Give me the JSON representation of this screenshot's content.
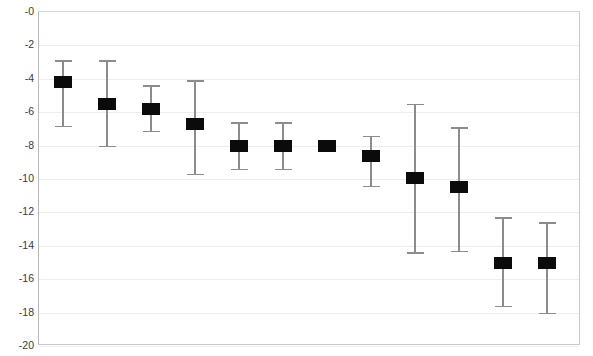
{
  "chart_data": {
    "type": "scatter",
    "title": "",
    "subtitle": "",
    "xlabel": "",
    "ylabel": "",
    "legend": [],
    "legend_position": "none",
    "grid": true,
    "grid_axis": "y",
    "xlim": [
      0.5,
      12.5
    ],
    "ylim": [
      -20,
      0
    ],
    "x_axis_visible_ticks": false,
    "x_tick_labels": [],
    "y_ticks": [
      0,
      -2,
      -4,
      -6,
      -8,
      -10,
      -12,
      -14,
      -16,
      -18,
      -20
    ],
    "y_tick_labels": [
      "-0",
      "-2",
      "-4",
      "-6",
      "-8",
      "-10",
      "-12",
      "-14",
      "-16",
      "-18",
      "-20"
    ],
    "marker_style": "filled-square",
    "marker_color": "#0b0b0b",
    "errorbar_color": "#8c8c8c",
    "x": [
      1,
      2,
      3,
      4,
      5,
      6,
      7,
      8,
      9,
      10,
      11,
      12
    ],
    "values": [
      -4.2,
      -5.5,
      -5.8,
      -6.7,
      -8.0,
      -8.0,
      -8.0,
      -8.65,
      -9.95,
      -10.45,
      -15.05,
      -15.0
    ],
    "err_low": [
      -6.8,
      -8.0,
      -7.1,
      -9.7,
      -9.4,
      -9.4,
      -8.1,
      -10.4,
      -14.4,
      -14.3,
      -17.6,
      -18.0
    ],
    "err_high": [
      -2.9,
      -2.9,
      -4.4,
      -4.1,
      -6.6,
      -6.6,
      -7.9,
      -7.4,
      -5.5,
      -6.9,
      -12.3,
      -12.6
    ]
  },
  "plot": {
    "left_px": 38,
    "top_px": 11,
    "width_px": 542,
    "height_px": 334,
    "x_start_px": 62,
    "x_step_px": 44,
    "marker_width_px": 18,
    "marker_height_px": 12
  }
}
